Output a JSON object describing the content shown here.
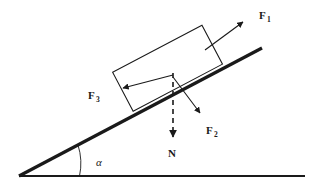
{
  "figure": {
    "background_color": "#ffffff",
    "stroke_color": "#1a1a1a",
    "width": 317,
    "height": 193
  },
  "labels": {
    "f1": {
      "symbol": "F",
      "subscript": "1",
      "full": "F1"
    },
    "f2": {
      "symbol": "F",
      "subscript": "2",
      "full": "F2"
    },
    "f3": {
      "symbol": "F",
      "subscript": "3",
      "full": "F3"
    },
    "normal": {
      "symbol": "N",
      "subscript": "",
      "full": "N"
    },
    "angle": {
      "symbol": "α",
      "full": "α"
    }
  },
  "elements": {
    "ground_line": "horizontal-ground",
    "incline_line": "inclined-surface",
    "block": "rectangular-block",
    "angle_arc": "angle-arc",
    "arrow_f1": "force-arrow-f1",
    "arrow_f2": "force-arrow-f2",
    "arrow_f3": "force-arrow-f3",
    "arrow_n": "normal-dashed-arrow"
  }
}
